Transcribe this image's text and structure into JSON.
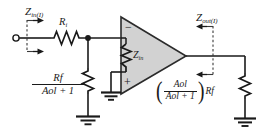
{
  "figure": {
    "kind": "circuit-schematic",
    "colors": {
      "wire": "#1a1a1a",
      "opamp_fill": "#d2d2d2",
      "opamp_edge": "#2b2b2b",
      "background": "#ffffff",
      "dashed": "#3a3a3a"
    }
  },
  "labels": {
    "z_in_closed": {
      "base": "Z",
      "sub": "in(I)"
    },
    "r_input": {
      "base": "R",
      "sub": "i"
    },
    "z_in_opamp": {
      "base": "Z",
      "sub": "in"
    },
    "z_out_closed": {
      "base": "Z",
      "sub": "out(I)"
    },
    "opamp_minus": "−",
    "opamp_plus": "+"
  },
  "expressions": {
    "input_impedance": {
      "numerator": {
        "base": "R",
        "sub": "f"
      },
      "denominator": {
        "base": "A",
        "sub": "ol",
        "tail": " + 1"
      },
      "plain": "Rf / (Aol + 1)"
    },
    "output_impedance": {
      "open_paren": "(",
      "close_paren": ")",
      "numerator": {
        "base": "A",
        "sub": "ol"
      },
      "denominator": {
        "base": "A",
        "sub": "ol",
        "tail": " + 1"
      },
      "trailing": {
        "base": "R",
        "sub": "f"
      },
      "plain": "(Aol / (Aol + 1)) Rf"
    }
  },
  "components": {
    "input_terminal": "open-circle-terminal",
    "series_resistor": "resistor-Ri",
    "shunt_resistor_left": "resistor-Rf-over-Aol-plus-1",
    "internal_resistor": "resistor-Zin",
    "load_resistor_right": "resistor-Aol-over-Aol-plus-1-Rf",
    "grounds": [
      "ground-opamp-noninverting",
      "ground-left-shunt",
      "ground-right-load"
    ],
    "node_dot": "junction-node",
    "amplifier": "op-amp-triangle"
  },
  "annotations": {
    "input_arrows": "two-right-arrows-on-dashed-port",
    "output_arrows": "two-left-arrows-on-dashed-port"
  }
}
